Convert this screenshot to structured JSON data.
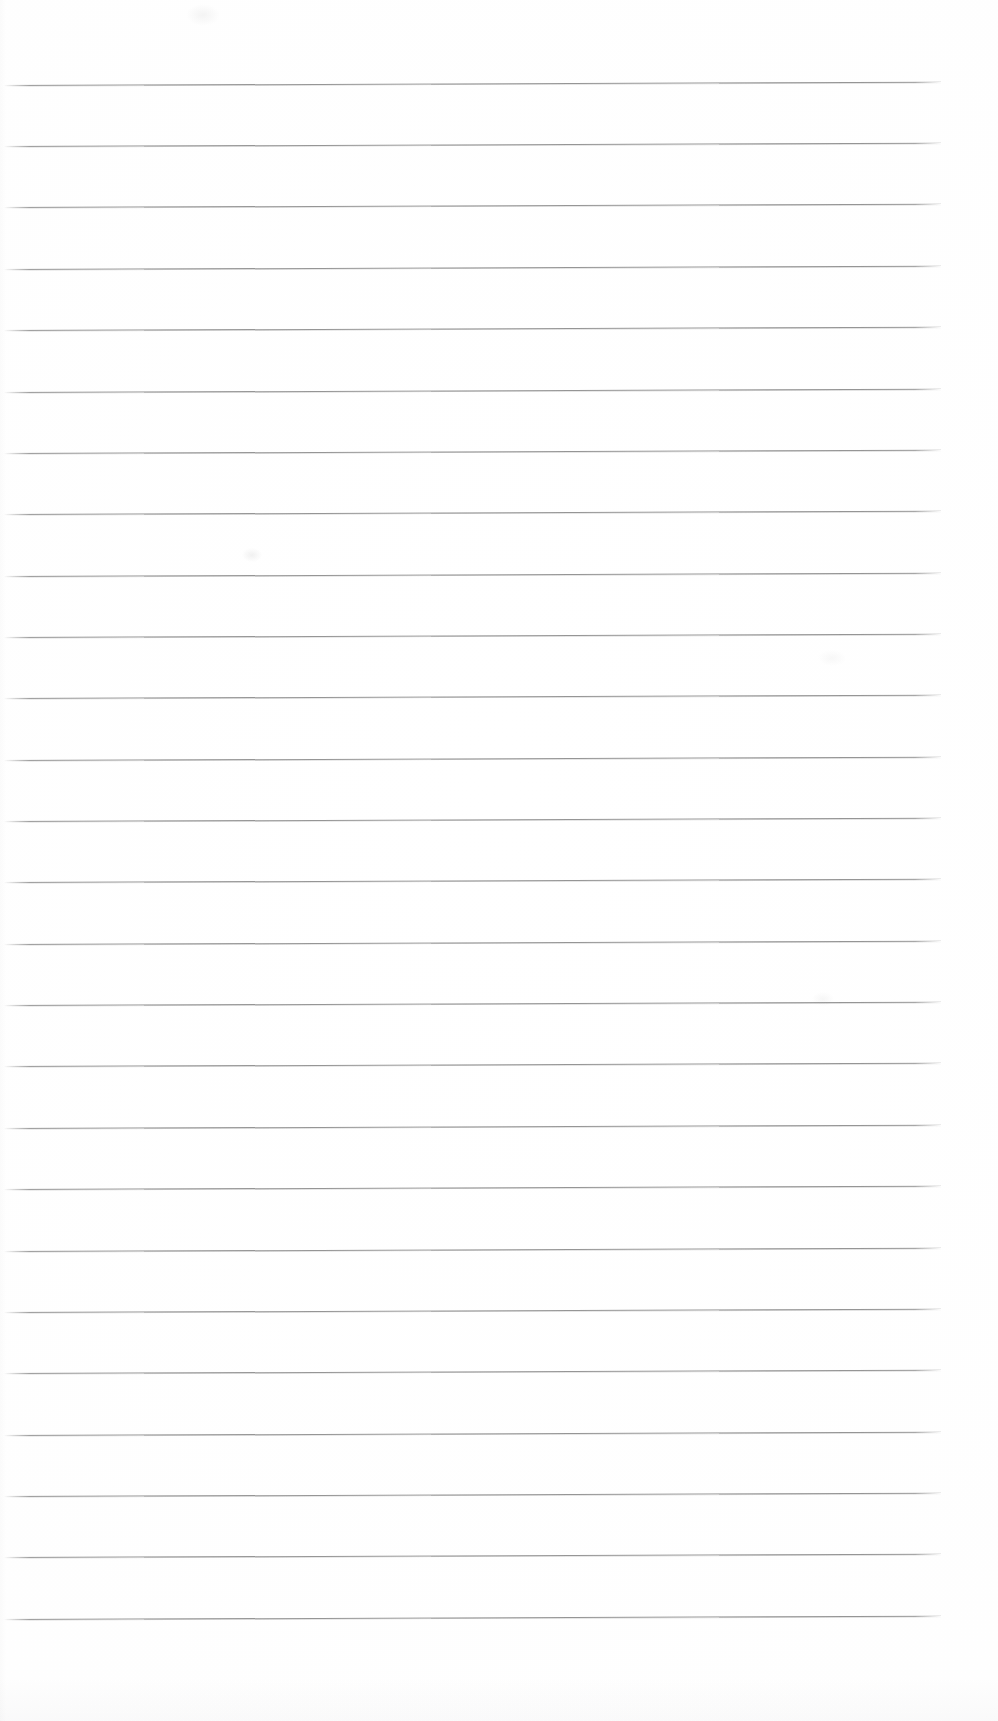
{
  "page": {
    "kind": "scanned-blank-ruled-notebook-page",
    "width": 998,
    "height": 1721,
    "background_color": "#fefefe",
    "text_content": "",
    "handwriting_present": false,
    "printed_text_present": false
  },
  "ruling": {
    "line_color": "#909090",
    "line_count": 26,
    "first_line_y": 85,
    "line_spacing": 61.4,
    "line_start_x": 4,
    "line_end_x": 942,
    "line_thickness": 1.2,
    "skew_degrees": -0.2,
    "lines": [
      {
        "index": 1,
        "y": 85,
        "x_start": 4,
        "x_end": 941
      },
      {
        "index": 2,
        "y": 146,
        "x_start": 4,
        "x_end": 941
      },
      {
        "index": 3,
        "y": 207,
        "x_start": 4,
        "x_end": 941
      },
      {
        "index": 4,
        "y": 269,
        "x_start": 4,
        "x_end": 941
      },
      {
        "index": 5,
        "y": 330,
        "x_start": 4,
        "x_end": 941
      },
      {
        "index": 6,
        "y": 392,
        "x_start": 4,
        "x_end": 941
      },
      {
        "index": 7,
        "y": 453,
        "x_start": 4,
        "x_end": 941
      },
      {
        "index": 8,
        "y": 514,
        "x_start": 4,
        "x_end": 941
      },
      {
        "index": 9,
        "y": 576,
        "x_start": 4,
        "x_end": 941
      },
      {
        "index": 10,
        "y": 637,
        "x_start": 4,
        "x_end": 941
      },
      {
        "index": 11,
        "y": 698,
        "x_start": 4,
        "x_end": 941
      },
      {
        "index": 12,
        "y": 760,
        "x_start": 4,
        "x_end": 941
      },
      {
        "index": 13,
        "y": 821,
        "x_start": 4,
        "x_end": 941
      },
      {
        "index": 14,
        "y": 882,
        "x_start": 4,
        "x_end": 941
      },
      {
        "index": 15,
        "y": 944,
        "x_start": 4,
        "x_end": 941
      },
      {
        "index": 16,
        "y": 1005,
        "x_start": 4,
        "x_end": 941
      },
      {
        "index": 17,
        "y": 1066,
        "x_start": 4,
        "x_end": 941
      },
      {
        "index": 18,
        "y": 1128,
        "x_start": 4,
        "x_end": 941
      },
      {
        "index": 19,
        "y": 1189,
        "x_start": 4,
        "x_end": 941
      },
      {
        "index": 20,
        "y": 1251,
        "x_start": 4,
        "x_end": 941
      },
      {
        "index": 21,
        "y": 1312,
        "x_start": 4,
        "x_end": 941
      },
      {
        "index": 22,
        "y": 1373,
        "x_start": 4,
        "x_end": 941
      },
      {
        "index": 23,
        "y": 1435,
        "x_start": 4,
        "x_end": 941
      },
      {
        "index": 24,
        "y": 1496,
        "x_start": 4,
        "x_end": 941
      },
      {
        "index": 25,
        "y": 1557,
        "x_start": 4,
        "x_end": 941
      },
      {
        "index": 26,
        "y": 1619,
        "x_start": 4,
        "x_end": 941
      }
    ]
  },
  "margins": {
    "top_margin": 85,
    "bottom_margin": 102,
    "left_margin": 4,
    "right_margin": 57
  },
  "artifacts": [
    {
      "name": "smudge-top",
      "x": 186,
      "y": 4,
      "width": 34,
      "height": 22
    },
    {
      "name": "smudge-mid",
      "x": 242,
      "y": 548,
      "width": 20,
      "height": 14
    },
    {
      "name": "smudge-mid2",
      "x": 818,
      "y": 650,
      "width": 28,
      "height": 16
    },
    {
      "name": "smudge-mid3",
      "x": 812,
      "y": 992,
      "width": 22,
      "height": 14
    },
    {
      "name": "bleed-bottom",
      "x": 0,
      "y": 1677,
      "width": 998,
      "height": 44
    }
  ]
}
